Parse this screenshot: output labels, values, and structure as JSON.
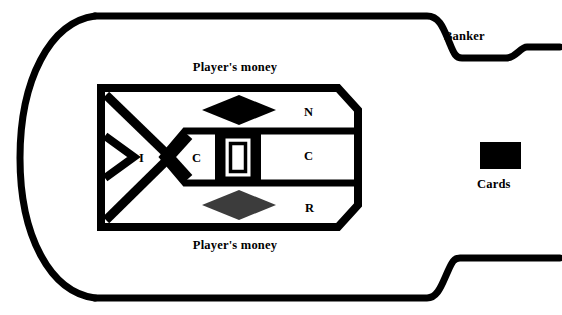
{
  "diagram": {
    "labels": {
      "players_money_top": "Player's money",
      "players_money_bottom": "Player's money",
      "banker": "Banker",
      "cards": "Cards"
    },
    "betting_cells": [
      {
        "id": "caller-I",
        "letter": "I"
      },
      {
        "id": "croupier-left-C",
        "letter": "C"
      },
      {
        "id": "numbers-N",
        "letter": "N"
      },
      {
        "id": "croupier-right-C",
        "letter": "C"
      },
      {
        "id": "rail-R",
        "letter": "R"
      }
    ],
    "markers": [
      {
        "id": "diamond-top",
        "shape": "diamond",
        "fill": "#000000"
      },
      {
        "id": "diamond-bottom",
        "shape": "diamond",
        "fill": "#3c3c3c"
      },
      {
        "id": "shoe-box",
        "shape": "nested-rectangle",
        "fill": "#ffffff",
        "stroke": "#000000"
      },
      {
        "id": "cards-block",
        "shape": "rectangle",
        "fill": "#000000"
      }
    ],
    "colors": {
      "ink": "#000000",
      "gray_diamond": "#3c3c3c",
      "background": "#ffffff"
    },
    "stroke_widths": {
      "table_outline": 7,
      "layout_outline": 8,
      "layout_divider": 7
    }
  }
}
